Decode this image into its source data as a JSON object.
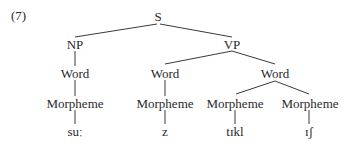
{
  "example_number": "(7)",
  "tree": {
    "root": "S",
    "phrases": {
      "np": "NP",
      "vp": "VP"
    },
    "words": [
      "Word",
      "Word",
      "Word"
    ],
    "morphemes": [
      "Morpheme",
      "Morpheme",
      "Morpheme",
      "Morpheme"
    ],
    "leaves": [
      "suː",
      "z",
      "tɪkl",
      "ɪʃ"
    ]
  },
  "colors": {
    "text": "#2a2a2a",
    "line": "#3a3a3a",
    "background": "#ffffff"
  }
}
